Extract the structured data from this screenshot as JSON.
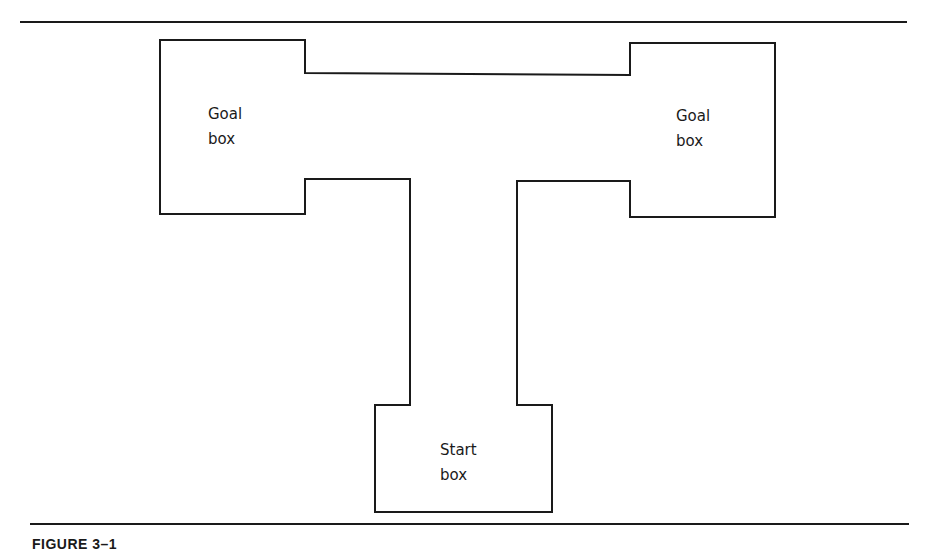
{
  "figure": {
    "caption": "FIGURE 3–1",
    "type": "T-maze diagram",
    "labels": {
      "left_goal": [
        "Goal",
        "box"
      ],
      "right_goal": [
        "Goal",
        "box"
      ],
      "start": [
        "Start",
        "box"
      ]
    },
    "stroke_color": "#1a1a1a",
    "background": "#ffffff"
  }
}
